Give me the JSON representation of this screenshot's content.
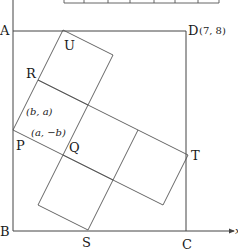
{
  "diagram": {
    "type": "geometry",
    "square_labels": {
      "A": "A",
      "B": "B",
      "C": "C",
      "D": "D"
    },
    "d_coordinate": "(7, 8)",
    "point_labels": {
      "P": "P",
      "Q": "Q",
      "R": "R",
      "S": "S",
      "T": "T",
      "U": "U"
    },
    "vector_labels": {
      "PR": "(b, a)",
      "PQ": "(a, −b)"
    },
    "axis_labels": {
      "x": "x"
    },
    "colors": {
      "line": "#444444",
      "text": "#1a1a1a",
      "background": "#ffffff"
    }
  }
}
